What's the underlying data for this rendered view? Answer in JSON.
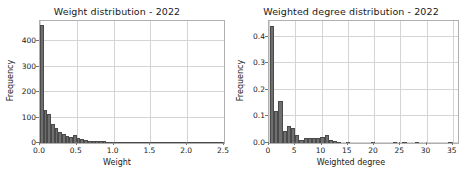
{
  "figure": {
    "background": "#ffffff",
    "bar_color": "#6f6f6f",
    "grid_color": "#d4d4d4",
    "axis_color": "#b0b0b0",
    "panel_count": 2
  },
  "chart_data": [
    {
      "type": "bar",
      "id": "weight-distribution",
      "title": "Weight distribution - 2022",
      "xlabel": "Weight",
      "ylabel": "Frequency",
      "xlim": [
        0.0,
        2.5
      ],
      "ylim": [
        0,
        480
      ],
      "grid": true,
      "legend": null,
      "xticks": [
        "0.0",
        "0.5",
        "1.0",
        "1.5",
        "2.0",
        "2.5"
      ],
      "xtick_values": [
        0.0,
        0.5,
        1.0,
        1.5,
        2.0,
        2.5
      ],
      "yticks": [
        "0",
        "100",
        "200",
        "300",
        "400"
      ],
      "ytick_values": [
        0,
        100,
        200,
        300,
        400
      ],
      "bin_width": 0.05,
      "bin_starts": [
        0.0,
        0.05,
        0.1,
        0.15,
        0.2,
        0.25,
        0.3,
        0.35,
        0.4,
        0.45,
        0.5,
        0.55,
        0.6,
        0.65,
        0.7,
        0.75,
        0.8,
        0.85,
        0.9,
        0.95,
        1.0,
        1.05,
        1.1,
        1.15,
        1.2,
        1.25,
        1.3,
        1.35,
        1.4,
        1.45,
        1.5,
        1.55,
        1.6,
        1.65,
        1.7,
        1.75,
        1.8,
        1.85,
        1.9,
        1.95,
        2.0,
        2.05,
        2.1,
        2.15,
        2.2,
        2.25,
        2.3,
        2.35,
        2.4,
        2.45
      ],
      "values": [
        465,
        128,
        116,
        75,
        60,
        44,
        36,
        28,
        25,
        30,
        18,
        14,
        12,
        9,
        8,
        7,
        6,
        6,
        5,
        5,
        5,
        4,
        4,
        4,
        3,
        3,
        3,
        3,
        3,
        2,
        2,
        2,
        2,
        2,
        2,
        2,
        2,
        1,
        1,
        1,
        1,
        1,
        1,
        1,
        1,
        1,
        1,
        1,
        1,
        1
      ]
    },
    {
      "type": "bar",
      "id": "weighted-degree-distribution",
      "title": "Weighted degree distribution - 2022",
      "xlabel": "Weighted degree",
      "ylabel": "Frequency",
      "xlim": [
        0,
        36
      ],
      "ylim": [
        0.0,
        0.46
      ],
      "grid": true,
      "legend": null,
      "xticks": [
        "0",
        "5",
        "10",
        "15",
        "20",
        "25",
        "30",
        "35"
      ],
      "xtick_values": [
        0,
        5,
        10,
        15,
        20,
        25,
        30,
        35
      ],
      "yticks": [
        "0.0",
        "0.1",
        "0.2",
        "0.3",
        "0.4"
      ],
      "ytick_values": [
        0.0,
        0.1,
        0.2,
        0.3,
        0.4
      ],
      "bin_width": 0.8,
      "bin_starts": [
        0.2,
        1.0,
        1.8,
        2.6,
        3.4,
        4.2,
        5.0,
        5.8,
        6.6,
        7.4,
        8.2,
        9.0,
        9.8,
        10.6,
        11.4,
        12.2,
        13.0,
        14.6,
        19.4,
        23.6,
        25.4,
        27.8,
        34.0
      ],
      "values": [
        0.44,
        0.12,
        0.16,
        0.045,
        0.065,
        0.055,
        0.03,
        0.012,
        0.02,
        0.02,
        0.02,
        0.02,
        0.022,
        0.031,
        0.012,
        0.008,
        0.004,
        0.005,
        0.005,
        0.005,
        0.005,
        0.005,
        0.005
      ]
    }
  ]
}
